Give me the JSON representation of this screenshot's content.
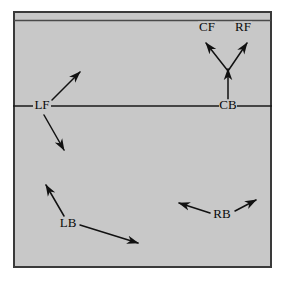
{
  "figure": {
    "kind": "vector-field-diagram",
    "width": 289,
    "height": 281,
    "background_color": "#ffffff",
    "panel": {
      "x": 13,
      "y": 11,
      "width": 259,
      "height": 257,
      "fill_color": "#c8c8c8",
      "border_color": "#3a3a3a",
      "border_width": 2,
      "has_inner_top_rule": true,
      "inner_top_rule_y": 20,
      "inner_top_rule_color": "#4a4a4a"
    },
    "horizontal_axis": {
      "label": "",
      "y": 106,
      "x_start": 13,
      "x_end": 272,
      "color": "#1a1a1a",
      "width": 1.6
    },
    "line_color": "#111111",
    "label_color": "#0a0a0a",
    "label_font_size": 13
  },
  "nodes": [
    {
      "id": "CF",
      "label": "CF",
      "x": 207,
      "y": 28
    },
    {
      "id": "RF",
      "label": "RF",
      "x": 243,
      "y": 28
    },
    {
      "id": "LF",
      "label": "LF",
      "x": 42,
      "y": 106
    },
    {
      "id": "CB",
      "label": "CB",
      "x": 228,
      "y": 106
    },
    {
      "id": "LB",
      "label": "LB",
      "x": 68,
      "y": 224
    },
    {
      "id": "RB",
      "label": "RB",
      "x": 222,
      "y": 215
    }
  ],
  "arrows": [
    {
      "name": "lf-up-right",
      "from_node": "LF",
      "x1": 52,
      "y1": 100,
      "x2": 80,
      "y2": 72,
      "arrowhead": "end"
    },
    {
      "name": "lf-down-right",
      "from_node": "LF",
      "x1": 44,
      "y1": 115,
      "x2": 64,
      "y2": 150,
      "arrowhead": "end"
    },
    {
      "name": "cb-stem-up",
      "from_node": "CB",
      "x1": 228,
      "y1": 99,
      "x2": 228,
      "y2": 69,
      "arrowhead": "end"
    },
    {
      "name": "cb-to-cf",
      "from_node": "CB",
      "x1": 228,
      "y1": 71,
      "x2": 206,
      "y2": 43,
      "arrowhead": "end"
    },
    {
      "name": "cb-to-rf",
      "from_node": "CB",
      "x1": 228,
      "y1": 71,
      "x2": 247,
      "y2": 43,
      "arrowhead": "end"
    },
    {
      "name": "lb-up-left",
      "from_node": "LB",
      "x1": 64,
      "y1": 216,
      "x2": 46,
      "y2": 185,
      "arrowhead": "end"
    },
    {
      "name": "lb-down-right",
      "from_node": "LB",
      "x1": 80,
      "y1": 225,
      "x2": 138,
      "y2": 243,
      "arrowhead": "end"
    },
    {
      "name": "rb-up-left",
      "from_node": "RB",
      "x1": 210,
      "y1": 213,
      "x2": 179,
      "y2": 203,
      "arrowhead": "end"
    },
    {
      "name": "rb-up-right",
      "from_node": "RB",
      "x1": 235,
      "y1": 211,
      "x2": 256,
      "y2": 200,
      "arrowhead": "end"
    }
  ]
}
